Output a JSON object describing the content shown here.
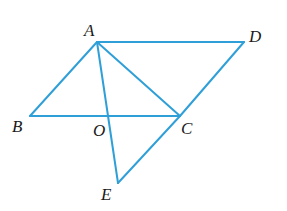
{
  "diagram": {
    "type": "geometry-figure",
    "line_color": "#2f9fd8",
    "label_color": "#1a1a1a",
    "points": {
      "A": {
        "x": 97,
        "y": 42
      },
      "B": {
        "x": 30,
        "y": 116
      },
      "C": {
        "x": 180,
        "y": 116
      },
      "D": {
        "x": 244,
        "y": 42
      },
      "O": {
        "x": 108,
        "y": 116
      },
      "E": {
        "x": 118,
        "y": 183
      }
    },
    "segments": [
      [
        "A",
        "D"
      ],
      [
        "A",
        "B"
      ],
      [
        "A",
        "C"
      ],
      [
        "A",
        "E"
      ],
      [
        "B",
        "C"
      ],
      [
        "D",
        "C"
      ],
      [
        "C",
        "E"
      ]
    ],
    "labels": [
      {
        "text": "A",
        "x": 84,
        "y": 36
      },
      {
        "text": "D",
        "x": 249,
        "y": 42
      },
      {
        "text": "B",
        "x": 12,
        "y": 132
      },
      {
        "text": "O",
        "x": 93,
        "y": 136
      },
      {
        "text": "C",
        "x": 181,
        "y": 134
      },
      {
        "text": "E",
        "x": 101,
        "y": 200
      }
    ]
  }
}
